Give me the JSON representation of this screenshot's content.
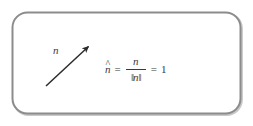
{
  "figure": {
    "kind": "math-diagram",
    "background_color": "#ffffff",
    "frame": {
      "shape": "rounded-rectangle",
      "stroke_color": "#8c8c8c",
      "shadow_color": "#6e6e6e",
      "stroke_width": 2,
      "corner_radius": 15
    },
    "arrow": {
      "label": "n",
      "color": "#2b2b2b",
      "tail": {
        "x": 46,
        "y": 86
      },
      "tip": {
        "x": 91,
        "y": 44
      },
      "direction": "up-right"
    },
    "equation": {
      "unit_vector": "n",
      "hat": "^",
      "equals": "=",
      "numerator": "n",
      "norm_open": "‖",
      "norm_symbol": "n",
      "norm_close": "‖",
      "equals_2": "=",
      "result": "1",
      "plain_text": "n̂ = n / ‖n‖ = 1",
      "text_color": "#3a3a3a"
    }
  }
}
